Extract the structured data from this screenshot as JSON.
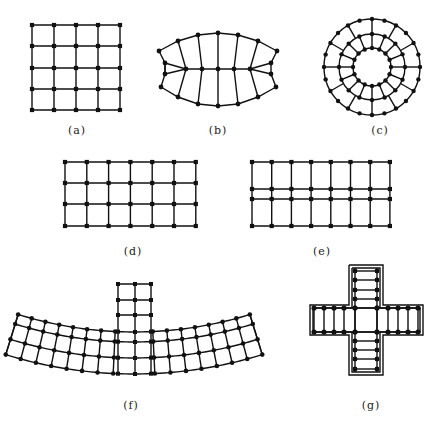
{
  "figure": {
    "panels": [
      {
        "id": "a",
        "label": "(a)",
        "description": "Uniform square grid, 5x5 nodes"
      },
      {
        "id": "b",
        "label": "(b)",
        "description": "Lens-shaped curved mesh with center line"
      },
      {
        "id": "c",
        "label": "(c)",
        "description": "Annular ring mesh, 3 concentric rings with radial lines"
      },
      {
        "id": "d",
        "label": "(d)",
        "description": "Rectangular grid, 7 columns x 4 rows of nodes"
      },
      {
        "id": "e",
        "label": "(e)",
        "description": "Rectangular grid, 8 columns x 4 rows with narrow middle band"
      },
      {
        "id": "f",
        "label": "(f)",
        "description": "Curved arc band mesh with vertical stem at center"
      },
      {
        "id": "g",
        "label": "(g)",
        "description": "Cross-shaped mesh with double outline"
      }
    ]
  },
  "colors": {
    "line": "#111111",
    "node": "#111111",
    "background": "#ffffff"
  }
}
